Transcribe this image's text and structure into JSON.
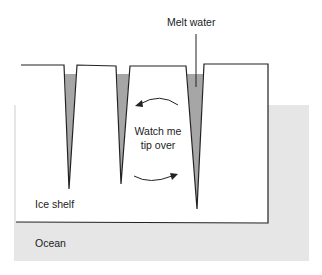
{
  "labels": {
    "melt_water": "Melt water",
    "watch_line1": "Watch me",
    "watch_line2": "tip over",
    "ice_shelf": "Ice shelf",
    "ocean": "Ocean"
  },
  "colors": {
    "ocean": "#e6e6e6",
    "melt_water": "#a6a6a6",
    "outline": "#222222",
    "ice": "#ffffff"
  }
}
